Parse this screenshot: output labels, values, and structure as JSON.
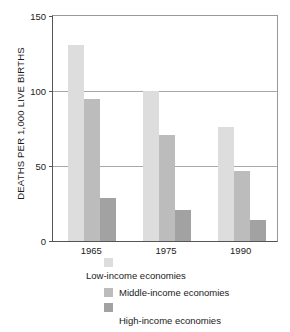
{
  "chart_data": {
    "type": "bar",
    "title": "",
    "xlabel": "",
    "ylabel": "DEATHS PER 1,000 LIVE BIRTHS",
    "categories": [
      "1965",
      "1975",
      "1990"
    ],
    "series": [
      {
        "name": "Low-income economies",
        "color": "#dddddd",
        "values": [
          131,
          100,
          76
        ]
      },
      {
        "name": "Middle-income economies",
        "color": "#bcbcbc",
        "values": [
          95,
          71,
          47
        ]
      },
      {
        "name": "High-income economies",
        "color": "#a2a2a2",
        "values": [
          29,
          21,
          14
        ]
      }
    ],
    "ylim": [
      0,
      150
    ],
    "yticks": [
      0,
      50,
      100,
      150
    ],
    "ytick_labels": [
      "0",
      "50",
      "100",
      "150"
    ],
    "grid": true,
    "legend_position": "bottom"
  },
  "legend": {
    "items": [
      {
        "label": "Low-income economies",
        "swatch": "low"
      },
      {
        "label": "Middle-income economies",
        "swatch": "middle"
      },
      {
        "label": "High-income economies",
        "swatch": "high"
      }
    ]
  }
}
